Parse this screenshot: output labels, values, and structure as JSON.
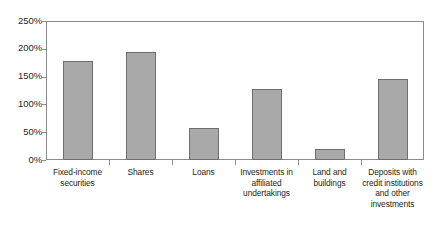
{
  "chart_data": {
    "type": "bar",
    "title": "",
    "xlabel": "",
    "ylabel": "",
    "categories": [
      "Fixed-income securities",
      "Shares",
      "Loans",
      "Investments in affiliated undertakings",
      "Land and buildings",
      "Deposits with credit institutions and other investments"
    ],
    "values": [
      178,
      195,
      57,
      128,
      20,
      145
    ],
    "value_suffix": "%",
    "ylim": [
      0,
      250
    ],
    "ytick_values": [
      0,
      50,
      100,
      150,
      200,
      250
    ],
    "ytick_labels": [
      "0%",
      "50%",
      "100%",
      "150%",
      "200%",
      "250%"
    ],
    "grid": false,
    "legend": null,
    "bar_color": "#a9a9a9",
    "bar_border_color": "#6e6e6e",
    "axis_color": "#8c8c8c",
    "text_color": "#231f20",
    "background_color": "#ffffff"
  }
}
